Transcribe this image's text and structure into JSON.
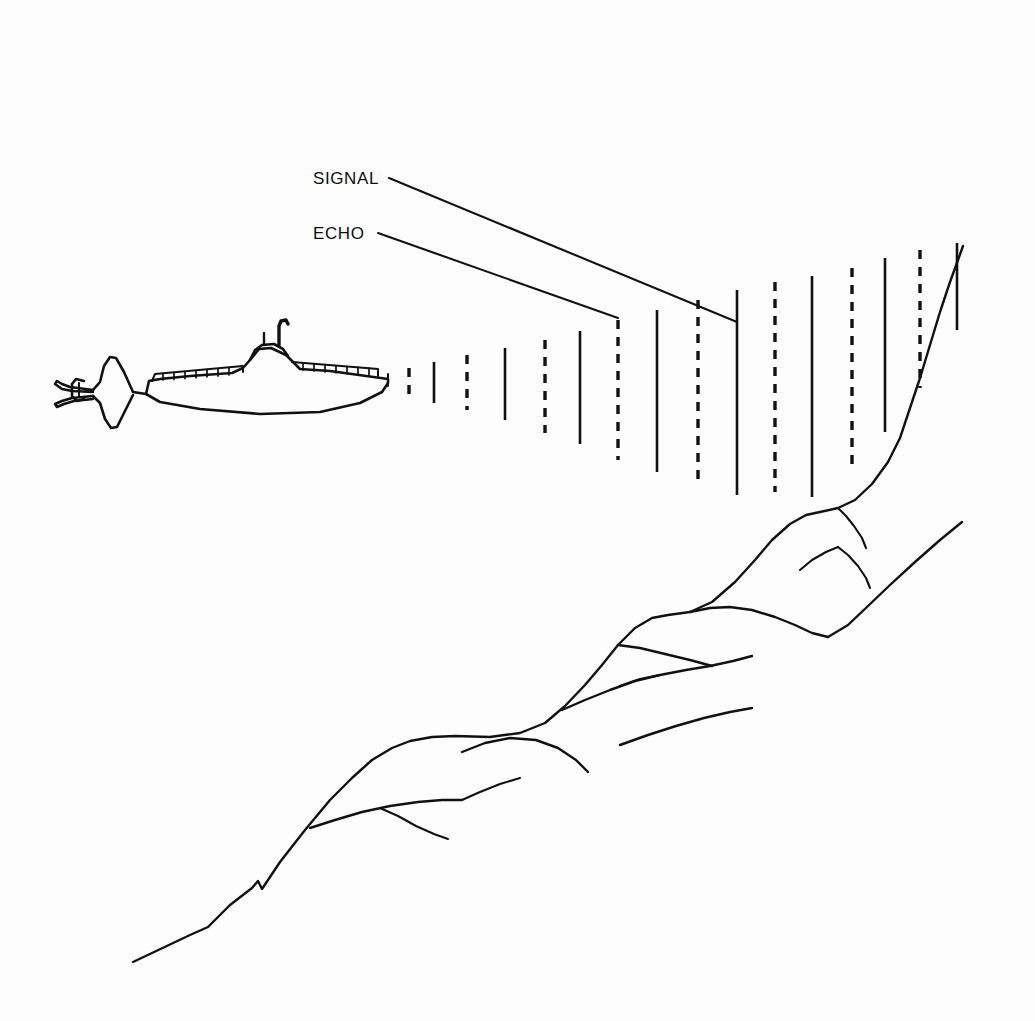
{
  "figure": {
    "background_color": "#fdfdfd",
    "ink_color": "#111111",
    "width": 1035,
    "height": 1021
  },
  "labels": {
    "signal": {
      "text": "SIGNAL",
      "x": 313,
      "y": 184,
      "leader_from": [
        389,
        178
      ],
      "leader_to": [
        737,
        322
      ]
    },
    "echo": {
      "text": "ECHO",
      "x": 313,
      "y": 239,
      "leader_from": [
        378,
        233
      ],
      "leader_to": [
        618,
        318
      ]
    }
  },
  "submarine": {
    "name": "submarine",
    "heading": "right",
    "bow_x": 388,
    "stern_x": 55,
    "deck_y": 375,
    "keel_y": 412,
    "conning_tower": {
      "x": 258,
      "y": 340,
      "masts": 2
    },
    "deck_rail_segments_fore": 7,
    "deck_rail_segments_aft": 12
  },
  "wave_fronts": {
    "legend": {
      "solid": "signal",
      "dashed": "echo"
    },
    "dash_pattern": "9 8",
    "lines": [
      {
        "kind": "echo",
        "style": "dashed",
        "x": 409,
        "y_top": 368,
        "y_bottom": 395
      },
      {
        "kind": "signal",
        "style": "solid",
        "x": 434,
        "y_top": 362,
        "y_bottom": 403
      },
      {
        "kind": "echo",
        "style": "dashed",
        "x": 467,
        "y_top": 355,
        "y_bottom": 410
      },
      {
        "kind": "signal",
        "style": "solid",
        "x": 505,
        "y_top": 348,
        "y_bottom": 420
      },
      {
        "kind": "echo",
        "style": "dashed",
        "x": 545,
        "y_top": 340,
        "y_bottom": 433
      },
      {
        "kind": "signal",
        "style": "solid",
        "x": 580,
        "y_top": 331,
        "y_bottom": 444
      },
      {
        "kind": "echo",
        "style": "dashed",
        "x": 618,
        "y_top": 320,
        "y_bottom": 460
      },
      {
        "kind": "signal",
        "style": "solid",
        "x": 657,
        "y_top": 310,
        "y_bottom": 472
      },
      {
        "kind": "echo",
        "style": "dashed",
        "x": 698,
        "y_top": 300,
        "y_bottom": 484
      },
      {
        "kind": "signal",
        "style": "solid",
        "x": 737,
        "y_top": 290,
        "y_bottom": 495
      },
      {
        "kind": "echo",
        "style": "dashed",
        "x": 775,
        "y_top": 282,
        "y_bottom": 492
      },
      {
        "kind": "signal",
        "style": "solid",
        "x": 812,
        "y_top": 276,
        "y_bottom": 497
      },
      {
        "kind": "echo",
        "style": "dashed",
        "x": 852,
        "y_top": 268,
        "y_bottom": 470
      },
      {
        "kind": "signal",
        "style": "solid",
        "x": 885,
        "y_top": 258,
        "y_bottom": 432
      },
      {
        "kind": "echo",
        "style": "dashed",
        "x": 920,
        "y_top": 250,
        "y_bottom": 388
      },
      {
        "kind": "signal",
        "style": "solid",
        "x": 957,
        "y_top": 243,
        "y_bottom": 330
      }
    ]
  },
  "seafloor": {
    "name": "rocky-seabed-slope",
    "description": "Rising rocky slope from lower left to upper right with outcrops and fissures"
  }
}
